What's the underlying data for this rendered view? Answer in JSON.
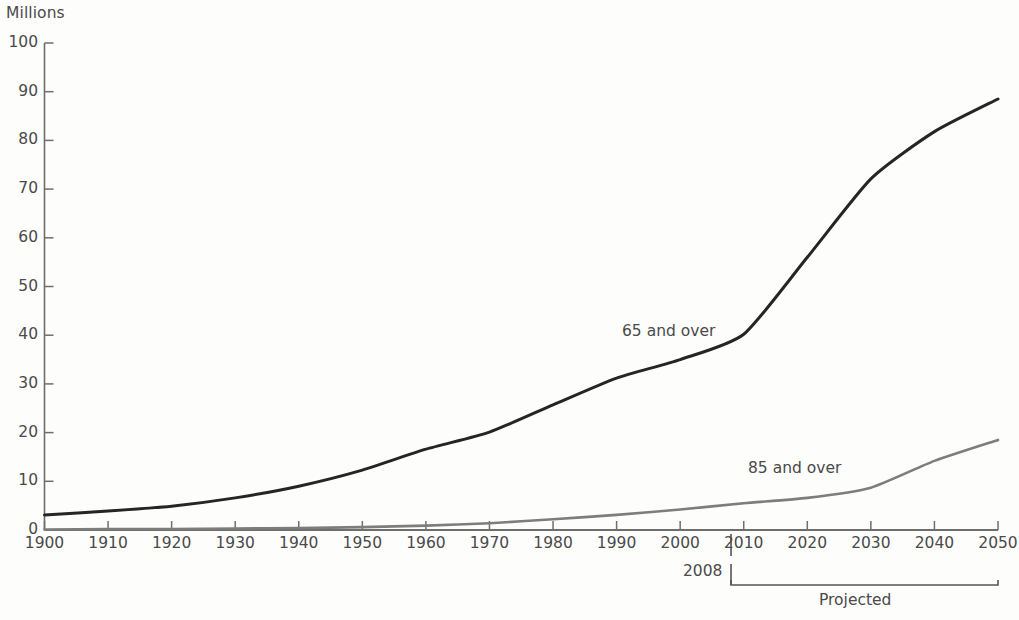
{
  "chart_data": {
    "type": "line",
    "title": "",
    "ylabel": "Millions",
    "xlabel": "",
    "ylim": [
      0,
      100
    ],
    "xlim": [
      1900,
      2050
    ],
    "ytick_step": 10,
    "xtick_step": 10,
    "grid": false,
    "legend_position": "inline-labels",
    "ytick_labels": [
      "100",
      "90",
      "80",
      "70",
      "60",
      "50",
      "40",
      "30",
      "20",
      "10",
      "0"
    ],
    "ytick_values": [
      100,
      90,
      80,
      70,
      60,
      50,
      40,
      30,
      20,
      10,
      0
    ],
    "xtick_labels": [
      "1900",
      "1910",
      "1920",
      "1930",
      "1940",
      "1950",
      "1960",
      "1970",
      "1980",
      "1990",
      "2000",
      "2010",
      "2020",
      "2030",
      "2040",
      "2050"
    ],
    "xtick_values": [
      1900,
      1910,
      1920,
      1930,
      1940,
      1950,
      1960,
      1970,
      1980,
      1990,
      2000,
      2010,
      2020,
      2030,
      2040,
      2050
    ],
    "x": [
      1900,
      1910,
      1920,
      1930,
      1940,
      1950,
      1960,
      1970,
      1980,
      1990,
      2000,
      2010,
      2020,
      2030,
      2040,
      2050
    ],
    "series": [
      {
        "name": "65 and over",
        "color": "#252525",
        "values": [
          3.1,
          3.9,
          4.9,
          6.6,
          9.0,
          12.3,
          16.6,
          20.1,
          25.7,
          31.2,
          35.0,
          40.2,
          56.0,
          72.1,
          81.8,
          88.5
        ]
      },
      {
        "name": "85 and over",
        "color": "#7d7d7d",
        "values": [
          0.1,
          0.2,
          0.2,
          0.3,
          0.4,
          0.6,
          0.9,
          1.4,
          2.2,
          3.1,
          4.2,
          5.5,
          6.6,
          8.7,
          14.2,
          18.5
        ]
      }
    ],
    "annotations": [
      {
        "name": "divider-2008",
        "label": "2008",
        "x": 2008,
        "type": "vertical-divider"
      },
      {
        "name": "projected-bracket",
        "label": "Projected",
        "x_start": 2008,
        "x_end": 2050,
        "type": "bracket"
      }
    ]
  },
  "series_labels": {
    "s65": "65 and over",
    "s85": "85 and over"
  },
  "annotation_labels": {
    "year_2008": "2008",
    "projected": "Projected"
  }
}
